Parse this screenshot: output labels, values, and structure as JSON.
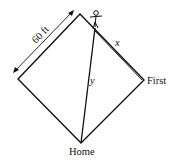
{
  "diagram": {
    "type": "baseball-diamond-related-rates",
    "labels": {
      "side_length": "60 ft",
      "x_label": "x",
      "y_label": "y",
      "first_base": "First",
      "home_plate": "Home"
    },
    "colors": {
      "stroke": "#111111",
      "background": "#ffffff"
    }
  }
}
